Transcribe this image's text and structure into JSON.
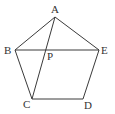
{
  "diagram": {
    "type": "geometry",
    "points": {
      "A": {
        "label": "A",
        "x": 55,
        "y": 17,
        "lx": 51,
        "ly": 13
      },
      "B": {
        "label": "B",
        "x": 15,
        "y": 50,
        "lx": 4,
        "ly": 54
      },
      "C": {
        "label": "C",
        "x": 32,
        "y": 99,
        "lx": 23,
        "ly": 108
      },
      "D": {
        "label": "D",
        "x": 83,
        "y": 99,
        "lx": 84,
        "ly": 109
      },
      "E": {
        "label": "E",
        "x": 99,
        "y": 50,
        "lx": 101,
        "ly": 54
      },
      "P": {
        "label": "P",
        "x": 46,
        "y": 50,
        "lx": 47,
        "ly": 60
      }
    },
    "segments": [
      [
        "A",
        "B"
      ],
      [
        "B",
        "C"
      ],
      [
        "C",
        "D"
      ],
      [
        "D",
        "E"
      ],
      [
        "E",
        "A"
      ],
      [
        "A",
        "C"
      ],
      [
        "B",
        "E"
      ]
    ]
  }
}
